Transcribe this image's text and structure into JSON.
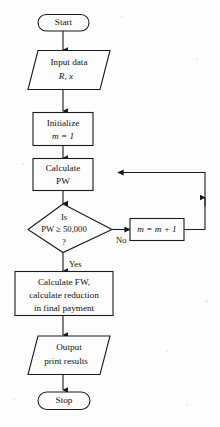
{
  "diagram": {
    "type": "flowchart",
    "background_color": "#fdfdfd",
    "line_color": "#1b1b1b",
    "nodes": [
      {
        "id": "start",
        "shape": "terminator",
        "lines": [
          "Start"
        ]
      },
      {
        "id": "input",
        "shape": "parallelogram",
        "lines": [
          "Input data",
          "R, x"
        ]
      },
      {
        "id": "initialize",
        "shape": "rectangle",
        "lines": [
          "Initialize",
          "m = 1"
        ]
      },
      {
        "id": "calculate-pw",
        "shape": "rectangle",
        "lines": [
          "Calculate",
          "PW"
        ]
      },
      {
        "id": "decision",
        "shape": "diamond",
        "lines": [
          "Is",
          "PW ≥ 50,000",
          "?"
        ]
      },
      {
        "id": "increment",
        "shape": "rectangle",
        "lines": [
          "m = m + 1"
        ]
      },
      {
        "id": "calculate-fw",
        "shape": "rectangle",
        "lines": [
          "Calculate FW,",
          "calculate reduction",
          "in final payment"
        ]
      },
      {
        "id": "output",
        "shape": "parallelogram",
        "lines": [
          "Output",
          "print results"
        ]
      },
      {
        "id": "stop",
        "shape": "terminator",
        "lines": [
          "Stop"
        ]
      }
    ],
    "edge_labels": {
      "no": "No",
      "yes": "Yes"
    }
  }
}
